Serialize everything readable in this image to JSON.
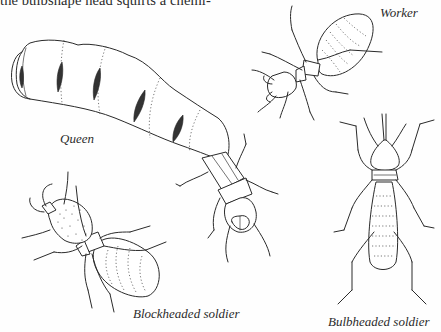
{
  "page": {
    "body_text": "the bulbshape head squirts a chemi-"
  },
  "figure": {
    "captions": {
      "worker": "Worker",
      "queen": "Queen",
      "blockheaded_soldier": "Blockheaded soldier",
      "bulbheaded_soldier": "Bulbheaded soldier"
    },
    "illustrations": [
      {
        "name": "queen-termite",
        "label": "Queen"
      },
      {
        "name": "worker-termite",
        "label": "Worker"
      },
      {
        "name": "blockheaded-soldier-termite",
        "label": "Blockheaded soldier"
      },
      {
        "name": "bulbheaded-soldier-termite",
        "label": "Bulbheaded soldier"
      }
    ]
  }
}
